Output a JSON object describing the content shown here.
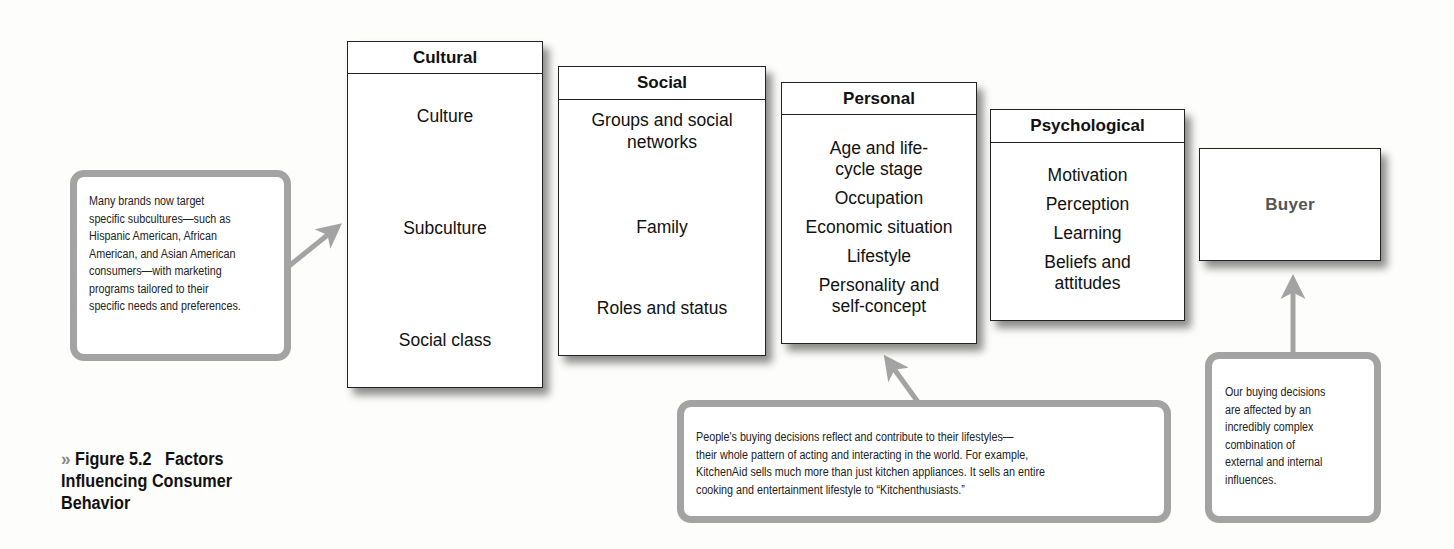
{
  "caption": {
    "icon": "double-chevron-right-icon",
    "icon_glyph": "»",
    "figure_number": "Figure 5.2",
    "title_line1": "Factors",
    "title_line2": "Influencing Consumer",
    "title_line3": "Behavior"
  },
  "factors": [
    {
      "title": "Cultural",
      "items": [
        "Culture",
        "Subculture",
        "Social class"
      ]
    },
    {
      "title": "Social",
      "items": [
        "Groups and social",
        "networks",
        "Family",
        "Roles and status"
      ]
    },
    {
      "title": "Personal",
      "items": [
        "Age and life-",
        "cycle stage",
        "Occupation",
        "Economic situation",
        "Lifestyle",
        "Personality and",
        "self-concept"
      ]
    },
    {
      "title": "Psychological",
      "items": [
        "Motivation",
        "Perception",
        "Learning",
        "Beliefs and",
        "attitudes"
      ]
    }
  ],
  "buyer": {
    "label": "Buyer"
  },
  "callouts": {
    "cultural": {
      "lines": [
        "Many brands now target",
        "specific subcultures—such as",
        "Hispanic American, African",
        "American, and Asian American",
        "consumers—with marketing",
        "programs tailored to their",
        "specific needs and preferences."
      ]
    },
    "personal": {
      "lines": [
        "People's buying decisions reflect and contribute to their lifestyles—",
        "their whole pattern of acting and interacting in the world. For example,",
        "KitchenAid sells much more than just kitchen appliances. It sells an entire",
        "cooking and entertainment lifestyle to “Kitchenthusiasts.”"
      ]
    },
    "buyer": {
      "lines": [
        "Our buying decisions",
        "are affected by an",
        "incredibly complex",
        "combination of",
        "external and internal",
        "influences."
      ]
    }
  },
  "colors": {
    "callout_border": "#a3a3a3",
    "arrow": "#a3a3a3",
    "box_border": "#222222",
    "buyer_text": "#555555"
  }
}
